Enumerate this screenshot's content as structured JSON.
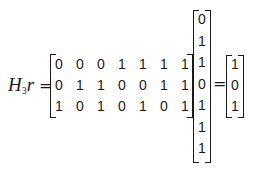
{
  "equation": {
    "lhs_symbol": "H",
    "lhs_subscript": "3",
    "lhs_vector": "r",
    "equals": "=",
    "matrix_H3": [
      [
        "0",
        "0",
        "0",
        "1",
        "1",
        "1",
        "1"
      ],
      [
        "0",
        "1",
        "1",
        "0",
        "0",
        "1",
        "1"
      ],
      [
        "1",
        "0",
        "1",
        "0",
        "1",
        "0",
        "1"
      ]
    ],
    "vector_r": [
      "0",
      "1",
      "1",
      "0",
      "1",
      "1",
      "1"
    ],
    "result": [
      "1",
      "0",
      "1"
    ]
  }
}
